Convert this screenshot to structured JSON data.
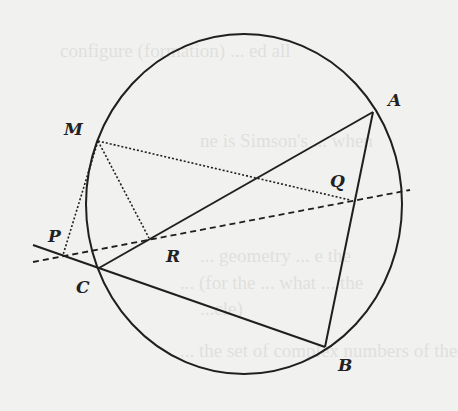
{
  "figure": {
    "labels": {
      "A": "A",
      "B": "B",
      "C": "C",
      "M": "M",
      "P": "P",
      "Q": "Q",
      "R": "R"
    },
    "points": {
      "A": [
        373,
        112
      ],
      "B": [
        325,
        347
      ],
      "C": [
        99,
        268
      ],
      "M": [
        98,
        141
      ],
      "P": [
        63,
        255
      ],
      "Q": [
        350,
        200
      ],
      "R": [
        149,
        238
      ]
    },
    "circle": {
      "cx": 244,
      "cy": 204,
      "rx": 158,
      "ry": 170
    },
    "colors": {
      "ink": "#1f1f1f",
      "paper": "#f1f1ef"
    }
  },
  "bleed_text": [
    "configure (formation) ... ed all",
    "ne is Simson's ... when",
    "... geometry ... e the",
    "... (for the ... what ... the",
    "...cle)",
    "... the set of complex numbers of the"
  ]
}
